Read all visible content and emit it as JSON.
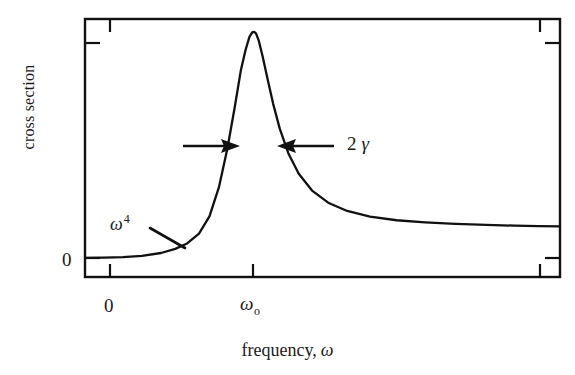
{
  "figure": {
    "type": "scientific-line-plot",
    "background_color": "#ffffff",
    "line_color": "#000000"
  },
  "axes": {
    "y_label": "cross section",
    "x_label_text": "frequency,",
    "x_label_symbol": "ω",
    "y_tick_labels": [
      "0"
    ],
    "x_tick_labels": [
      "0",
      "ω",
      "o"
    ],
    "x_tick_zero": "0",
    "x_tick_omega_base": "ω",
    "x_tick_omega_sub": "o"
  },
  "annotations": {
    "low_frequency": {
      "base": "ω",
      "exponent": "4",
      "description": "omega-to-the-fourth low-frequency Rayleigh scaling"
    },
    "linewidth": {
      "number": "2",
      "symbol": "γ",
      "description": "full width at half maximum equals two gamma"
    }
  },
  "chart_data": {
    "type": "line",
    "title": "",
    "xlabel": "frequency, ω",
    "ylabel": "cross section",
    "grid": false,
    "legend": null,
    "xlim": [
      0,
      1
    ],
    "ylim": [
      0,
      1
    ],
    "axis_box": true,
    "ticks": {
      "x": [
        {
          "label": "0",
          "pos": 0.053
        },
        {
          "label": "ωo",
          "pos": 0.354
        },
        {
          "label": "",
          "pos": 0.958
        }
      ],
      "y": [
        {
          "label": "0",
          "pos": 0.074
        },
        {
          "label": "",
          "pos": 0.908
        }
      ]
    },
    "series": [
      {
        "name": "resonance cross section",
        "comment": "Lorentzian resonance with omega^4 rise and flat high-frequency tail",
        "x": [
          0.0,
          0.04,
          0.08,
          0.12,
          0.16,
          0.19,
          0.215,
          0.24,
          0.262,
          0.282,
          0.3,
          0.315,
          0.328,
          0.338,
          0.346,
          0.352,
          0.356,
          0.36,
          0.366,
          0.374,
          0.384,
          0.396,
          0.41,
          0.428,
          0.45,
          0.478,
          0.512,
          0.552,
          0.6,
          0.656,
          0.716,
          0.78,
          0.845,
          0.905,
          0.955,
          1.0
        ],
        "y": [
          0.074,
          0.075,
          0.077,
          0.082,
          0.093,
          0.109,
          0.13,
          0.168,
          0.235,
          0.348,
          0.5,
          0.656,
          0.8,
          0.88,
          0.93,
          0.948,
          0.95,
          0.944,
          0.915,
          0.855,
          0.77,
          0.672,
          0.575,
          0.48,
          0.4,
          0.335,
          0.288,
          0.256,
          0.234,
          0.22,
          0.212,
          0.206,
          0.202,
          0.199,
          0.197,
          0.196
        ]
      }
    ],
    "peak": {
      "x": 0.356,
      "y": 0.95,
      "label": "ωo"
    },
    "fwhm_marker": {
      "label": "2 γ",
      "level_y": 0.497
    },
    "lowfreq_marker": {
      "label": "ω4"
    }
  }
}
